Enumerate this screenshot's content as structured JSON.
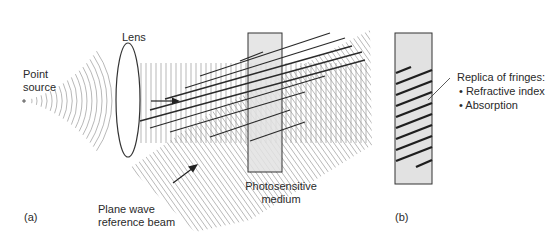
{
  "labels": {
    "point_source": [
      "Point",
      "source"
    ],
    "lens": "Lens",
    "plane_wave": [
      "Plane wave",
      "reference beam"
    ],
    "medium": [
      "Photosensitive",
      "medium"
    ],
    "panel_a": "(a)",
    "panel_b": "(b)",
    "replica_title": "Replica of fringes:",
    "replica_items": [
      "• Refractive index",
      "• Absorption"
    ]
  },
  "colors": {
    "medium_fill": "#e2e2e2",
    "outline": "#333333",
    "wave_lines": "#9a9a9a",
    "fringe": "#2a2a2a"
  }
}
